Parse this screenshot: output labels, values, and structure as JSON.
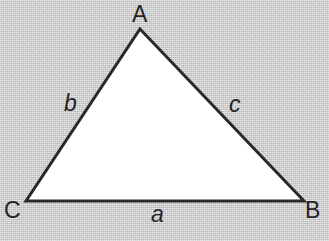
{
  "figure": {
    "type": "triangle-diagram",
    "background_color": "#c9c9c9",
    "fill_color": "#ffffff",
    "stroke_color": "#2a2a2a",
    "stroke_width": 3,
    "width": 329,
    "height": 241,
    "vertices": [
      {
        "id": "A",
        "label": "A",
        "x": 140,
        "y": 29
      },
      {
        "id": "B",
        "label": "B",
        "x": 304,
        "y": 201
      },
      {
        "id": "C",
        "label": "C",
        "x": 26,
        "y": 201
      }
    ],
    "sides": [
      {
        "id": "a",
        "label": "a",
        "between": "C-B",
        "x": 158,
        "y": 215
      },
      {
        "id": "b",
        "label": "b",
        "between": "C-A",
        "x": 71,
        "y": 104
      },
      {
        "id": "c",
        "label": "c",
        "between": "A-B",
        "x": 237,
        "y": 105
      }
    ]
  }
}
